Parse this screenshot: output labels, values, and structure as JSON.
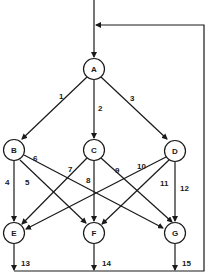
{
  "diagram": {
    "type": "directed-graph",
    "colors": {
      "stroke": "#1a1a1a",
      "background": "#ffffff"
    },
    "nodes": [
      {
        "id": "A",
        "label": "A",
        "x": 94,
        "y": 69
      },
      {
        "id": "B",
        "label": "B",
        "x": 14,
        "y": 150
      },
      {
        "id": "C",
        "label": "C",
        "x": 94,
        "y": 150
      },
      {
        "id": "D",
        "label": "D",
        "x": 175,
        "y": 151
      },
      {
        "id": "E",
        "label": "E",
        "x": 14,
        "y": 233
      },
      {
        "id": "F",
        "label": "F",
        "x": 94,
        "y": 233
      },
      {
        "id": "G",
        "label": "G",
        "x": 175,
        "y": 233
      }
    ],
    "edges": [
      {
        "label": "1",
        "from": "A",
        "to": "B"
      },
      {
        "label": "2",
        "from": "A",
        "to": "C"
      },
      {
        "label": "3",
        "from": "A",
        "to": "D"
      },
      {
        "label": "4",
        "from": "B",
        "to": "E"
      },
      {
        "label": "5",
        "from": "B",
        "to": "F"
      },
      {
        "label": "6",
        "from": "B",
        "to": "G"
      },
      {
        "label": "7",
        "from": "C",
        "to": "E"
      },
      {
        "label": "8",
        "from": "C",
        "to": "F"
      },
      {
        "label": "9",
        "from": "C",
        "to": "G"
      },
      {
        "label": "10",
        "from": "D",
        "to": "E"
      },
      {
        "label": "11",
        "from": "D",
        "to": "F"
      },
      {
        "label": "12",
        "from": "D",
        "to": "G"
      },
      {
        "label": "13",
        "from": "E",
        "to": "feedback"
      },
      {
        "label": "14",
        "from": "F",
        "to": "feedback"
      },
      {
        "label": "15",
        "from": "G",
        "to": "feedback"
      }
    ],
    "feedback_loop": {
      "description": "outputs of E, F, G join bottom line which returns to input of A"
    }
  }
}
